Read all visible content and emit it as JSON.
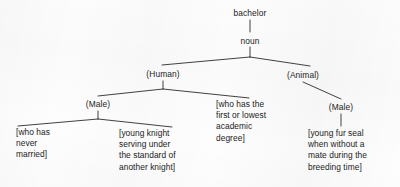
{
  "diagram": {
    "type": "lexical-semantic-tree",
    "headword": "bachelor",
    "background_color": "#fdfdfd",
    "ink_color": "#1b1b1b",
    "nodes": {
      "root": "bachelor",
      "pos": "noun",
      "human": "(Human)",
      "animal": "(Animal)",
      "human_male": "(Male)",
      "animal_male": "(Male)"
    },
    "leaves": {
      "never_married": "[who has\nnever\nmarried]",
      "young_knight": "[young knight\nserving under\nthe standard of\nanother knight]",
      "academic_degree": "[who has the\nfirst or lowest\nacademic\ndegree]",
      "fur_seal": "[young fur seal\nwhen without a\nmate during the\nbreeding time]"
    }
  }
}
